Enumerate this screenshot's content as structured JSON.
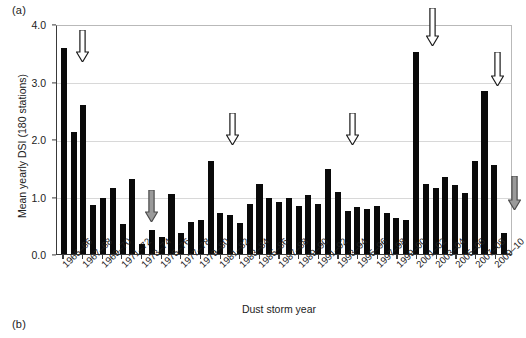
{
  "figure": {
    "panel_a_label": "(a)",
    "panel_b_label": "(b)"
  },
  "chart_data": {
    "type": "bar",
    "title": "",
    "xlabel": "Dust storm year",
    "ylabel": "Mean yearly DSI (180 stations)",
    "ylim": [
      0.0,
      4.0
    ],
    "yticks": [
      0.0,
      1.0,
      2.0,
      3.0,
      4.0
    ],
    "ytick_labels": [
      "0.0",
      "1.0",
      "2.0",
      "3.0",
      "4.0"
    ],
    "grid": true,
    "grid_axis": "y",
    "legend": "none",
    "bar_color": "#0a0a0a",
    "categories": [
      "1965-66",
      "1966-67",
      "1967-68",
      "1968-69",
      "1969-70",
      "1970-71",
      "1971-72",
      "1972-73",
      "1973-74",
      "1974-75",
      "1975-76",
      "1976-77",
      "1977-78",
      "1978-79",
      "1979-80",
      "1980-81",
      "1981-82",
      "1982-83",
      "1983-84",
      "1984-85",
      "1985-86",
      "1986-87",
      "1987-88",
      "1988-89",
      "1989-90",
      "1990-91",
      "1991-92",
      "1992-93",
      "1993-94",
      "1994-95",
      "1995-96",
      "1996-97",
      "1997-98",
      "1998-99",
      "1999-00",
      "2000-01",
      "2001-02",
      "2002-03",
      "2003-04",
      "2004-05",
      "2005-06",
      "2006-07",
      "2007-08",
      "2008-09",
      "2009-10",
      "2010-11"
    ],
    "tick_labels": [
      "1965–66",
      "1967–68",
      "1969–70",
      "1971–72",
      "1973–74",
      "1975–76",
      "1977–78",
      "1979–80",
      "1981–82",
      "1983–84",
      "1985–86",
      "1987–88",
      "1989–90",
      "1991–92",
      "1993–94",
      "1995–96",
      "1997–98",
      "1999–00",
      "2001–02",
      "2003–04",
      "2005–06",
      "2007–08",
      "2009–10"
    ],
    "values": [
      3.58,
      2.12,
      2.6,
      0.85,
      0.97,
      1.15,
      0.52,
      1.3,
      0.17,
      0.42,
      0.3,
      1.05,
      0.36,
      0.55,
      0.6,
      1.62,
      0.72,
      0.67,
      0.54,
      0.87,
      1.22,
      0.98,
      0.9,
      0.97,
      0.84,
      1.02,
      0.87,
      1.48,
      1.08,
      0.74,
      0.82,
      0.78,
      0.83,
      0.72,
      0.62,
      0.6,
      3.52,
      1.22,
      1.15,
      1.34,
      1.2,
      1.06,
      1.62,
      2.84,
      1.55,
      0.37
    ],
    "annotations": [
      {
        "name": "arrow-white-1",
        "style": "white",
        "category": "1966-67",
        "x_px": 76,
        "y_px": 30,
        "height_px": 32
      },
      {
        "name": "arrow-grey-1",
        "style": "grey",
        "category": "1974-75",
        "x_px": 145,
        "y_px": 190,
        "height_px": 32
      },
      {
        "name": "arrow-white-2",
        "style": "white",
        "category": "1980-81",
        "x_px": 226,
        "y_px": 113,
        "height_px": 32
      },
      {
        "name": "arrow-white-3",
        "style": "white",
        "category": "1992-93",
        "x_px": 346,
        "y_px": 113,
        "height_px": 32
      },
      {
        "name": "arrow-white-4",
        "style": "white",
        "category": "2001-02",
        "x_px": 426,
        "y_px": 8,
        "height_px": 38
      },
      {
        "name": "arrow-white-5",
        "style": "white",
        "category": "2008-09",
        "x_px": 491,
        "y_px": 52,
        "height_px": 34
      },
      {
        "name": "arrow-grey-2",
        "style": "grey",
        "category": "2010-11",
        "x_px": 508,
        "y_px": 176,
        "height_px": 34
      }
    ]
  }
}
